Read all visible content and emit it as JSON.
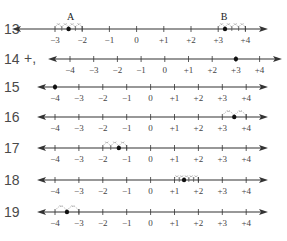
{
  "problems": [
    {
      "number": "13",
      "prefix": "",
      "y": 29,
      "x_at_min": 55,
      "unit": 27.2,
      "min": -3,
      "max": 4,
      "tick_labels": [
        "−3",
        "−2",
        "−1",
        "0",
        "+1",
        "+2",
        "+3",
        "+4"
      ],
      "arrow_left": 12,
      "arrow_right": 268,
      "points": [
        {
          "label": "A",
          "value": -2.5,
          "hops_from": -3,
          "hop_size": 0.25,
          "hop_count": 2,
          "hop_dir": "both"
        },
        {
          "label": "B",
          "value": 3.25,
          "hops_from": 3,
          "hop_size": 0.25,
          "hop_count": 4,
          "hop_dir": "right"
        }
      ]
    },
    {
      "number": "14",
      "prefix": "+,",
      "y": 59,
      "x_at_min": 70,
      "unit": 23.7,
      "min": -4,
      "max": 4,
      "tick_labels": [
        "−4",
        "−3",
        "−2",
        "−1",
        "0",
        "+1",
        "+2",
        "+3",
        "+4"
      ],
      "arrow_left": 48,
      "arrow_right": 282,
      "points": [
        {
          "label": "",
          "value": 3,
          "hops": []
        }
      ]
    },
    {
      "number": "15",
      "prefix": "",
      "y": 87,
      "x_at_min": 55,
      "unit": 23.9,
      "min": -4,
      "max": 4,
      "tick_labels": [
        "−4",
        "−3",
        "−2",
        "−1",
        "0",
        "+1",
        "+2",
        "+3",
        "+4"
      ],
      "arrow_left": 37,
      "arrow_right": 268,
      "points": [
        {
          "label": "",
          "value": -4,
          "hops": []
        }
      ]
    },
    {
      "number": "16",
      "prefix": "",
      "y": 117,
      "x_at_min": 55,
      "unit": 23.9,
      "min": -4,
      "max": 4,
      "tick_labels": [
        "−4",
        "−3",
        "−2",
        "−1",
        "0",
        "+1",
        "+2",
        "+3",
        "+4"
      ],
      "arrow_left": 37,
      "arrow_right": 268,
      "points": [
        {
          "label": "",
          "value": 3.5,
          "hops_from": 3,
          "hop_size": 0.5,
          "hop_count": 2,
          "hop_dir": "both"
        }
      ]
    },
    {
      "number": "17",
      "prefix": "",
      "y": 148,
      "x_at_min": 55,
      "unit": 23.9,
      "min": -4,
      "max": 4,
      "tick_labels": [
        "−4",
        "−3",
        "−2",
        "−1",
        "0",
        "+1",
        "+2",
        "+3",
        "+4"
      ],
      "arrow_left": 37,
      "arrow_right": 268,
      "points": [
        {
          "label": "",
          "value": -1.33,
          "hops_from": -2,
          "hop_size": 0.333,
          "hop_count": 3,
          "hop_dir": "both"
        }
      ]
    },
    {
      "number": "18",
      "prefix": "",
      "y": 180,
      "x_at_min": 55,
      "unit": 23.9,
      "min": -4,
      "max": 4,
      "tick_labels": [
        "−4",
        "−3",
        "−2",
        "−1",
        "0",
        "+1",
        "+2",
        "+3",
        "+4"
      ],
      "arrow_left": 37,
      "arrow_right": 268,
      "points": [
        {
          "label": "",
          "value": 1.4,
          "hops_from": 1,
          "hop_size": 0.2,
          "hop_count": 5,
          "hop_dir": "both"
        }
      ]
    },
    {
      "number": "19",
      "prefix": "",
      "y": 212,
      "x_at_min": 55,
      "unit": 23.9,
      "min": -4,
      "max": 4,
      "tick_labels": [
        "−4",
        "−3",
        "−2",
        "−1",
        "0",
        "+1",
        "+2",
        "+3",
        "+4"
      ],
      "arrow_left": 37,
      "arrow_right": 268,
      "points": [
        {
          "label": "",
          "value": -3.5,
          "hops_from": -4,
          "hop_size": 0.5,
          "hop_count": 2,
          "hop_dir": "both"
        }
      ]
    }
  ],
  "colors": {
    "line": "#333333",
    "number": "#555555",
    "dot": "#111111",
    "hop": "#888888"
  }
}
